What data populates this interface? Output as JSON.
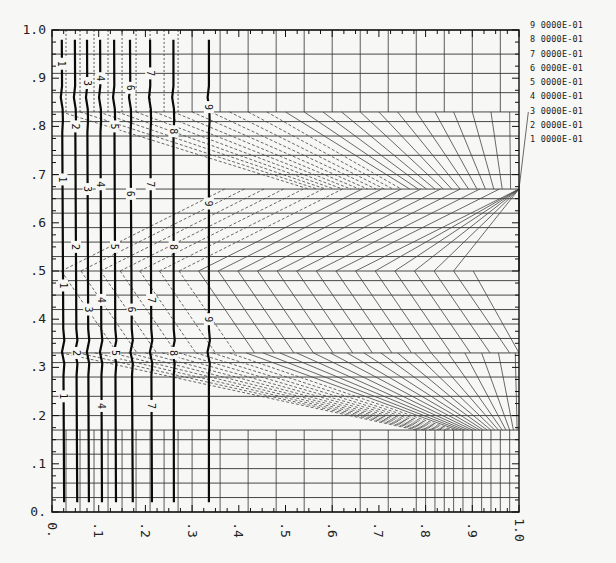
{
  "chart_data": {
    "type": "contour",
    "title": "",
    "xlabel": "",
    "ylabel": "",
    "xlim": [
      0,
      1.0
    ],
    "ylim": [
      0,
      1.0
    ],
    "grid": true,
    "x_ticks": [
      {
        "value": 0.0,
        "label": "0."
      },
      {
        "value": 0.1,
        "label": ".1"
      },
      {
        "value": 0.2,
        "label": ".2"
      },
      {
        "value": 0.3,
        "label": ".3"
      },
      {
        "value": 0.4,
        "label": ".4"
      },
      {
        "value": 0.5,
        "label": ".5"
      },
      {
        "value": 0.6,
        "label": ".6"
      },
      {
        "value": 0.7,
        "label": ".7"
      },
      {
        "value": 0.8,
        "label": ".8"
      },
      {
        "value": 0.9,
        "label": ".9"
      },
      {
        "value": 1.0,
        "label": "1.0"
      }
    ],
    "y_ticks": [
      {
        "value": 0.0,
        "label": "0."
      },
      {
        "value": 0.1,
        "label": ".1"
      },
      {
        "value": 0.2,
        "label": ".2"
      },
      {
        "value": 0.3,
        "label": ".3"
      },
      {
        "value": 0.4,
        "label": ".4"
      },
      {
        "value": 0.5,
        "label": ".5"
      },
      {
        "value": 0.6,
        "label": ".6"
      },
      {
        "value": 0.7,
        "label": ".7"
      },
      {
        "value": 0.8,
        "label": ".8"
      },
      {
        "value": 0.9,
        "label": ".9"
      },
      {
        "value": 1.0,
        "label": "1.0"
      }
    ],
    "legend": {
      "placement": "right",
      "entries": [
        "9 0000E-01",
        "8 0000E-01",
        "7 0000E-01",
        "6 0000E-01",
        "5 0000E-01",
        "4 0000E-01",
        "3 0000E-01",
        "2 0000E-01",
        "1 0000E-01"
      ]
    },
    "contours": [
      {
        "level": 1,
        "label": "1",
        "x_top": 0.021,
        "x_bottom": 0.026,
        "label_y": [
          0.93,
          0.69,
          0.47,
          0.24
        ]
      },
      {
        "level": 2,
        "label": "2",
        "x_top": 0.049,
        "x_bottom": 0.054,
        "label_y": [
          0.8,
          0.55,
          0.33
        ]
      },
      {
        "level": 3,
        "label": "3",
        "x_top": 0.075,
        "x_bottom": 0.079,
        "label_y": [
          0.89,
          0.67,
          0.42
        ]
      },
      {
        "level": 4,
        "label": "4",
        "x_top": 0.103,
        "x_bottom": 0.107,
        "label_y": [
          0.9,
          0.68,
          0.44,
          0.22
        ]
      },
      {
        "level": 5,
        "label": "5",
        "x_top": 0.133,
        "x_bottom": 0.137,
        "label_y": [
          0.8,
          0.55,
          0.33
        ]
      },
      {
        "level": 6,
        "label": "6",
        "x_top": 0.167,
        "x_bottom": 0.173,
        "label_y": [
          0.88,
          0.66,
          0.42
        ]
      },
      {
        "level": 7,
        "label": "7",
        "x_top": 0.21,
        "x_bottom": 0.214,
        "label_y": [
          0.91,
          0.68,
          0.44,
          0.22
        ]
      },
      {
        "level": 8,
        "label": "8",
        "x_top": 0.26,
        "x_bottom": 0.261,
        "label_y": [
          0.79,
          0.55,
          0.33
        ]
      },
      {
        "level": 9,
        "label": "9",
        "x_top": 0.336,
        "x_bottom": 0.336,
        "label_y": [
          0.84,
          0.64,
          0.4
        ]
      }
    ],
    "mesh": {
      "horizontal_lines_y": [
        0.0,
        0.03,
        0.06,
        0.09,
        0.12,
        0.15,
        0.17,
        0.2,
        0.24,
        0.28,
        0.31,
        0.33,
        0.36,
        0.39,
        0.42,
        0.45,
        0.48,
        0.5,
        0.53,
        0.56,
        0.59,
        0.62,
        0.65,
        0.67,
        0.7,
        0.74,
        0.78,
        0.81,
        0.83,
        0.87,
        0.91,
        0.95,
        1.0
      ],
      "bands": [
        0.0,
        0.17,
        0.33,
        0.5,
        0.67,
        0.83,
        1.0
      ],
      "vertical_lines_x": [
        0.03,
        0.06,
        0.09,
        0.12,
        0.15,
        0.18,
        0.21,
        0.24,
        0.27,
        0.3,
        0.36,
        0.42,
        0.48,
        0.54,
        0.6,
        0.66,
        0.72,
        0.78,
        0.8,
        0.82,
        0.84,
        0.86,
        0.88,
        0.9,
        0.92,
        0.94,
        0.96,
        0.98
      ]
    }
  }
}
